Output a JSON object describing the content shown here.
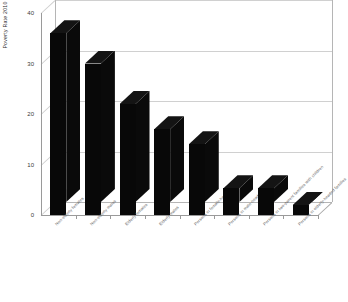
{
  "chart_data": {
    "type": "bar",
    "title": "",
    "xlabel": "",
    "ylabel": "Poverty Rate 2010",
    "ylim": [
      0,
      40
    ],
    "ytick_labels": [
      "0",
      "10",
      "20",
      "30",
      "40"
    ],
    "ytick_values": [
      0,
      10,
      20,
      30,
      40
    ],
    "grid": true,
    "legend": "none",
    "bar_color": "#080808",
    "gridline_color": "#d0d0d0",
    "axis_color": "#9a9a9a",
    "categories": [
      "Non-elderly females",
      "Non-elderly males",
      "Elderly females",
      "Elderly males",
      "Persons in female-head families",
      "Persons in male-head families",
      "Persons in two-parent families with children",
      "Persons in elderly-headed families"
    ],
    "values": [
      36,
      30,
      22,
      17,
      14,
      5.3,
      5.3,
      2
    ]
  },
  "axis": {
    "y_title": "Poverty Rate 2010"
  }
}
